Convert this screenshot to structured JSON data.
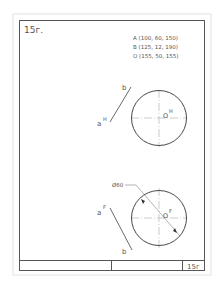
{
  "sheet": {
    "number": "15г.",
    "title_block_number": "15г"
  },
  "coordinates": {
    "lines": [
      "A (100, 60, 150)",
      "B (125, 12, 190)",
      "O (155, 50, 155)"
    ]
  },
  "top_view": {
    "point_a_label": "a",
    "point_a_super": "H",
    "point_b_label": "b",
    "center_label": "O",
    "center_super": "H"
  },
  "front_view": {
    "point_a_label": "a",
    "point_a_super": "F",
    "point_b_label": "b",
    "center_label": "O",
    "center_super": "F",
    "diameter_label": "Ø60"
  },
  "colors": {
    "frame": "#555555",
    "outer_border": "#dddddd",
    "centerline": "#999999"
  }
}
